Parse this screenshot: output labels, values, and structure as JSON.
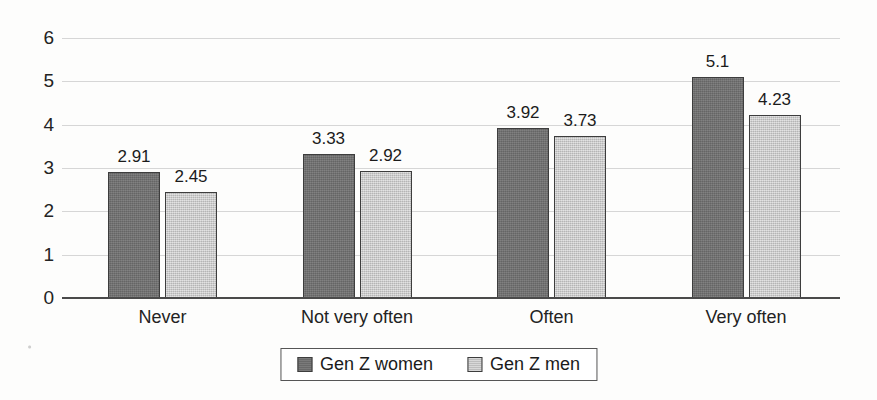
{
  "chart_data": {
    "type": "bar",
    "title": "",
    "subtitle": "",
    "xlabel": "",
    "ylabel": "",
    "categories": [
      "Never",
      "Not very often",
      "Often",
      "Very often"
    ],
    "series": [
      {
        "name": "Gen Z women",
        "color": "#6f6f6f",
        "values": [
          2.91,
          3.33,
          3.92,
          5.1
        ],
        "labels": [
          "2.91",
          "3.33",
          "3.92",
          "5.1"
        ]
      },
      {
        "name": "Gen Z men",
        "color": "#c7c7c7",
        "values": [
          2.45,
          2.92,
          3.73,
          4.23
        ],
        "labels": [
          "2.45",
          "2.92",
          "3.73",
          "4.23"
        ]
      }
    ],
    "ylim": [
      0,
      6
    ],
    "y_ticks": [
      "6",
      "5",
      "4",
      "3",
      "2",
      "1",
      "0"
    ],
    "y_tick_values": [
      6,
      5,
      4,
      3,
      2,
      1,
      0
    ],
    "grid": true,
    "grid_axis": "y",
    "legend_position": "bottom",
    "data_labels": true,
    "axis_color": "#4a4a4a",
    "grid_color": "#cfcfcf",
    "background_color": "#fdfdfc"
  },
  "legend": {
    "items": [
      {
        "label": "Gen Z women",
        "swatch": "dark-gray-swatch-icon"
      },
      {
        "label": "Gen Z men",
        "swatch": "light-gray-swatch-icon"
      }
    ]
  }
}
